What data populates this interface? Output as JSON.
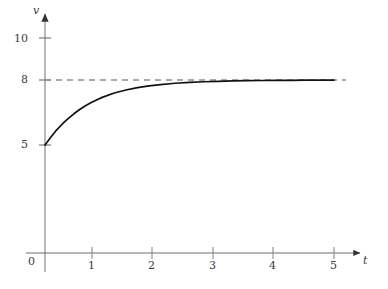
{
  "chart_data": {
    "type": "line",
    "title": "",
    "xlabel": "t",
    "ylabel": "v",
    "xlim": [
      0,
      5.45
    ],
    "ylim": [
      0,
      10.9
    ],
    "grid": false,
    "legend": null,
    "axis_labels": {
      "x_axis_name": "t",
      "y_axis_name": "v"
    },
    "xticks": [
      {
        "value": 0,
        "label": "0"
      },
      {
        "value": 1,
        "label": "1"
      },
      {
        "value": 2,
        "label": "2"
      },
      {
        "value": 3,
        "label": "3"
      },
      {
        "value": 4,
        "label": "4"
      },
      {
        "value": 5,
        "label": "5"
      }
    ],
    "yticks": [
      {
        "value": 5,
        "label": "5"
      },
      {
        "value": 8,
        "label": "8"
      },
      {
        "value": 10,
        "label": "10"
      }
    ],
    "series": [
      {
        "name": "v(t)",
        "type": "line",
        "style": "solid",
        "color": "#000000",
        "description": "exponential approach from v=5 to asymptote v=8",
        "x": [
          0.0,
          0.1,
          0.2,
          0.3,
          0.4,
          0.5,
          0.6,
          0.7,
          0.8,
          0.9,
          1.0,
          1.2,
          1.4,
          1.6,
          1.8,
          2.0,
          2.25,
          2.5,
          2.75,
          3.0,
          3.25,
          3.5,
          3.75,
          4.0,
          4.25,
          4.5,
          4.75,
          5.0
        ],
        "y": [
          5.0,
          5.36,
          5.69,
          5.97,
          6.22,
          6.44,
          6.64,
          6.81,
          6.96,
          7.09,
          7.21,
          7.4,
          7.54,
          7.65,
          7.73,
          7.79,
          7.85,
          7.89,
          7.92,
          7.94,
          7.955,
          7.967,
          7.976,
          7.982,
          7.987,
          7.99,
          7.993,
          7.995
        ]
      },
      {
        "name": "asymptote",
        "type": "line",
        "style": "dashed",
        "color": "#808080",
        "description": "horizontal asymptote at v = 8",
        "x": [
          0,
          5.0
        ],
        "y": [
          8,
          8
        ]
      }
    ],
    "annotations": [
      {
        "text": "8",
        "kind": "asymptote-value",
        "value": 8
      },
      {
        "text": "5",
        "kind": "initial-value",
        "value": 5
      }
    ]
  }
}
